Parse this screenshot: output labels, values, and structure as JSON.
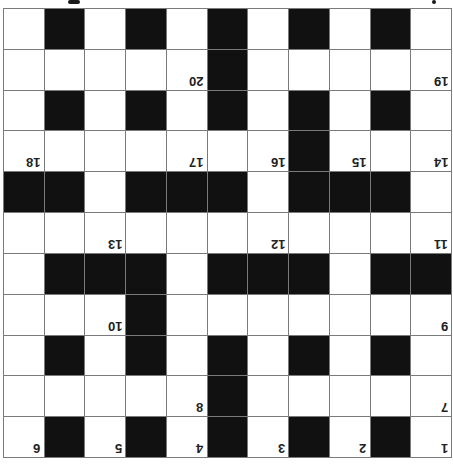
{
  "puzzle": {
    "type": "crossword",
    "orientation": "rotated-180",
    "rows": 11,
    "cols": 11,
    "colors": {
      "block": "#111111",
      "cell": "#ffffff",
      "gridline": "#7a7a7a"
    },
    "layout_as_displayed": [
      "WBWBWBWBWBW",
      "WWWWWBWWWWW",
      "WBWBWBWBWBW",
      "WWWWWWWBWWW",
      "BBWBBBWBBBW",
      "WWWWWWWWWWW",
      "WBBBWBBBWBB",
      "WWWBWWWWWWW",
      "WBWBWBWBWBW",
      "WWWWWBWWWWW",
      "WBWBWBWBWBW"
    ],
    "numbers_as_displayed": [
      {
        "row": 1,
        "col": 4,
        "n": "20"
      },
      {
        "row": 1,
        "col": 10,
        "n": "19"
      },
      {
        "row": 3,
        "col": 0,
        "n": "18"
      },
      {
        "row": 3,
        "col": 4,
        "n": "17"
      },
      {
        "row": 3,
        "col": 6,
        "n": "16"
      },
      {
        "row": 3,
        "col": 8,
        "n": "15"
      },
      {
        "row": 3,
        "col": 10,
        "n": "14"
      },
      {
        "row": 5,
        "col": 2,
        "n": "13"
      },
      {
        "row": 5,
        "col": 6,
        "n": "12"
      },
      {
        "row": 5,
        "col": 10,
        "n": "11"
      },
      {
        "row": 7,
        "col": 2,
        "n": "10"
      },
      {
        "row": 7,
        "col": 10,
        "n": "9"
      },
      {
        "row": 9,
        "col": 4,
        "n": "8"
      },
      {
        "row": 9,
        "col": 10,
        "n": "7"
      },
      {
        "row": 10,
        "col": 0,
        "n": "6"
      },
      {
        "row": 10,
        "col": 2,
        "n": "5"
      },
      {
        "row": 10,
        "col": 4,
        "n": "4"
      },
      {
        "row": 10,
        "col": 6,
        "n": "3"
      },
      {
        "row": 10,
        "col": 8,
        "n": "2"
      },
      {
        "row": 10,
        "col": 10,
        "n": "1"
      }
    ]
  }
}
